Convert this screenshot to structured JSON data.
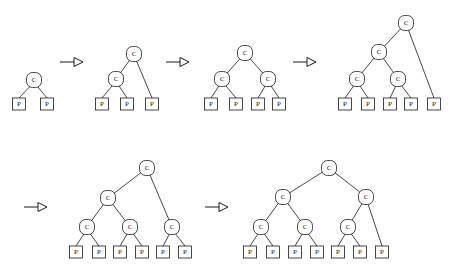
{
  "diagram": {
    "type": "tree-sequence",
    "background_color": "#ffffff",
    "stroke_color": "#1a1a1a",
    "node_labels": {
      "internal": "C",
      "leaf": "P"
    },
    "canvas": {
      "width": 449,
      "height": 275
    },
    "steps": [
      {
        "id": "step-1",
        "index": 1,
        "leaf_count": 2,
        "internal_count": 1,
        "nodes": [
          {
            "id": "s1c0",
            "kind": "internal",
            "label": "C",
            "x": 34,
            "y": 80
          },
          {
            "id": "s1p0",
            "kind": "leaf",
            "label": "P",
            "x": 19,
            "y": 104
          },
          {
            "id": "s1p1",
            "kind": "leaf",
            "label": "P",
            "x": 47,
            "y": 104
          }
        ],
        "edges": [
          {
            "from": "s1c0",
            "to": "s1p0"
          },
          {
            "from": "s1c0",
            "to": "s1p1"
          }
        ]
      },
      {
        "id": "step-2",
        "index": 2,
        "leaf_count": 3,
        "internal_count": 2,
        "nodes": [
          {
            "id": "s2c0",
            "kind": "internal",
            "label": "C",
            "x": 134,
            "y": 54
          },
          {
            "id": "s2c1",
            "kind": "internal",
            "label": "C",
            "x": 116,
            "y": 79
          },
          {
            "id": "s2p0",
            "kind": "leaf",
            "label": "P",
            "x": 102,
            "y": 104
          },
          {
            "id": "s2p1",
            "kind": "leaf",
            "label": "P",
            "x": 127,
            "y": 104
          },
          {
            "id": "s2p2",
            "kind": "leaf",
            "label": "P",
            "x": 152,
            "y": 104
          }
        ],
        "edges": [
          {
            "from": "s2c0",
            "to": "s2c1"
          },
          {
            "from": "s2c0",
            "to": "s2p2"
          },
          {
            "from": "s2c1",
            "to": "s2p0"
          },
          {
            "from": "s2c1",
            "to": "s2p1"
          }
        ]
      },
      {
        "id": "step-3",
        "index": 3,
        "leaf_count": 4,
        "internal_count": 3,
        "nodes": [
          {
            "id": "s3c0",
            "kind": "internal",
            "label": "C",
            "x": 245,
            "y": 53
          },
          {
            "id": "s3c1",
            "kind": "internal",
            "label": "C",
            "x": 222,
            "y": 79
          },
          {
            "id": "s3c2",
            "kind": "internal",
            "label": "C",
            "x": 268,
            "y": 79
          },
          {
            "id": "s3p0",
            "kind": "leaf",
            "label": "P",
            "x": 211,
            "y": 104
          },
          {
            "id": "s3p1",
            "kind": "leaf",
            "label": "P",
            "x": 236,
            "y": 104
          },
          {
            "id": "s3p2",
            "kind": "leaf",
            "label": "P",
            "x": 258,
            "y": 104
          },
          {
            "id": "s3p3",
            "kind": "leaf",
            "label": "P",
            "x": 279,
            "y": 104
          }
        ],
        "edges": [
          {
            "from": "s3c0",
            "to": "s3c1"
          },
          {
            "from": "s3c0",
            "to": "s3c2"
          },
          {
            "from": "s3c1",
            "to": "s3p0"
          },
          {
            "from": "s3c1",
            "to": "s3p1"
          },
          {
            "from": "s3c2",
            "to": "s3p2"
          },
          {
            "from": "s3c2",
            "to": "s3p3"
          }
        ]
      },
      {
        "id": "step-4",
        "index": 4,
        "leaf_count": 5,
        "internal_count": 4,
        "nodes": [
          {
            "id": "s4c0",
            "kind": "internal",
            "label": "C",
            "x": 406,
            "y": 23
          },
          {
            "id": "s4c1",
            "kind": "internal",
            "label": "C",
            "x": 379,
            "y": 52
          },
          {
            "id": "s4c2",
            "kind": "internal",
            "label": "C",
            "x": 357,
            "y": 79
          },
          {
            "id": "s4c3",
            "kind": "internal",
            "label": "C",
            "x": 398,
            "y": 79
          },
          {
            "id": "s4p0",
            "kind": "leaf",
            "label": "P",
            "x": 345,
            "y": 104
          },
          {
            "id": "s4p1",
            "kind": "leaf",
            "label": "P",
            "x": 368,
            "y": 104
          },
          {
            "id": "s4p2",
            "kind": "leaf",
            "label": "P",
            "x": 390,
            "y": 104
          },
          {
            "id": "s4p3",
            "kind": "leaf",
            "label": "P",
            "x": 411,
            "y": 104
          },
          {
            "id": "s4p4",
            "kind": "leaf",
            "label": "P",
            "x": 434,
            "y": 104
          }
        ],
        "edges": [
          {
            "from": "s4c0",
            "to": "s4c1"
          },
          {
            "from": "s4c0",
            "to": "s4p4"
          },
          {
            "from": "s4c1",
            "to": "s4c2"
          },
          {
            "from": "s4c1",
            "to": "s4c3"
          },
          {
            "from": "s4c2",
            "to": "s4p0"
          },
          {
            "from": "s4c2",
            "to": "s4p1"
          },
          {
            "from": "s4c3",
            "to": "s4p2"
          },
          {
            "from": "s4c3",
            "to": "s4p3"
          }
        ]
      },
      {
        "id": "step-5",
        "index": 5,
        "leaf_count": 6,
        "internal_count": 5,
        "nodes": [
          {
            "id": "s5c0",
            "kind": "internal",
            "label": "C",
            "x": 147,
            "y": 168
          },
          {
            "id": "s5c1",
            "kind": "internal",
            "label": "C",
            "x": 108,
            "y": 198
          },
          {
            "id": "s5c2",
            "kind": "internal",
            "label": "C",
            "x": 87,
            "y": 227
          },
          {
            "id": "s5c3",
            "kind": "internal",
            "label": "C",
            "x": 130,
            "y": 227
          },
          {
            "id": "s5c4",
            "kind": "internal",
            "label": "C",
            "x": 172,
            "y": 227
          },
          {
            "id": "s5p0",
            "kind": "leaf",
            "label": "P",
            "x": 76,
            "y": 252
          },
          {
            "id": "s5p1",
            "kind": "leaf",
            "label": "P",
            "x": 99,
            "y": 252
          },
          {
            "id": "s5p2",
            "kind": "leaf",
            "label": "P",
            "x": 120,
            "y": 252
          },
          {
            "id": "s5p3",
            "kind": "leaf",
            "label": "P",
            "x": 142,
            "y": 252
          },
          {
            "id": "s5p4",
            "kind": "leaf",
            "label": "P",
            "x": 163,
            "y": 252
          },
          {
            "id": "s5p5",
            "kind": "leaf",
            "label": "P",
            "x": 185,
            "y": 252
          }
        ],
        "edges": [
          {
            "from": "s5c0",
            "to": "s5c1"
          },
          {
            "from": "s5c0",
            "to": "s5c4"
          },
          {
            "from": "s5c1",
            "to": "s5c2"
          },
          {
            "from": "s5c1",
            "to": "s5c3"
          },
          {
            "from": "s5c2",
            "to": "s5p0"
          },
          {
            "from": "s5c2",
            "to": "s5p1"
          },
          {
            "from": "s5c3",
            "to": "s5p2"
          },
          {
            "from": "s5c3",
            "to": "s5p3"
          },
          {
            "from": "s5c4",
            "to": "s5p4"
          },
          {
            "from": "s5c4",
            "to": "s5p5"
          }
        ]
      },
      {
        "id": "step-6",
        "index": 6,
        "leaf_count": 7,
        "internal_count": 6,
        "nodes": [
          {
            "id": "s6c0",
            "kind": "internal",
            "label": "C",
            "x": 329,
            "y": 168
          },
          {
            "id": "s6c1",
            "kind": "internal",
            "label": "C",
            "x": 283,
            "y": 197
          },
          {
            "id": "s6c2",
            "kind": "internal",
            "label": "C",
            "x": 366,
            "y": 197
          },
          {
            "id": "s6c3",
            "kind": "internal",
            "label": "C",
            "x": 261,
            "y": 227
          },
          {
            "id": "s6c4",
            "kind": "internal",
            "label": "C",
            "x": 305,
            "y": 227
          },
          {
            "id": "s6c5",
            "kind": "internal",
            "label": "C",
            "x": 348,
            "y": 227
          },
          {
            "id": "s6p0",
            "kind": "leaf",
            "label": "P",
            "x": 250,
            "y": 252
          },
          {
            "id": "s6p1",
            "kind": "leaf",
            "label": "P",
            "x": 273,
            "y": 252
          },
          {
            "id": "s6p2",
            "kind": "leaf",
            "label": "P",
            "x": 295,
            "y": 252
          },
          {
            "id": "s6p3",
            "kind": "leaf",
            "label": "P",
            "x": 317,
            "y": 252
          },
          {
            "id": "s6p4",
            "kind": "leaf",
            "label": "P",
            "x": 338,
            "y": 252
          },
          {
            "id": "s6p5",
            "kind": "leaf",
            "label": "P",
            "x": 360,
            "y": 252
          },
          {
            "id": "s6p6",
            "kind": "leaf",
            "label": "P",
            "x": 382,
            "y": 252
          }
        ],
        "edges": [
          {
            "from": "s6c0",
            "to": "s6c1"
          },
          {
            "from": "s6c0",
            "to": "s6c2"
          },
          {
            "from": "s6c1",
            "to": "s6c3"
          },
          {
            "from": "s6c1",
            "to": "s6c4"
          },
          {
            "from": "s6c2",
            "to": "s6c5"
          },
          {
            "from": "s6c2",
            "to": "s6p6"
          },
          {
            "from": "s6c3",
            "to": "s6p0"
          },
          {
            "from": "s6c3",
            "to": "s6p1"
          },
          {
            "from": "s6c4",
            "to": "s6p2"
          },
          {
            "from": "s6c4",
            "to": "s6p3"
          },
          {
            "from": "s6c5",
            "to": "s6p4"
          },
          {
            "from": "s6c5",
            "to": "s6p5"
          }
        ]
      }
    ],
    "arrows": [
      {
        "id": "arrow-1",
        "from_step": "step-1",
        "to_step": "step-2",
        "x1": 60,
        "y1": 62,
        "x2": 83,
        "y2": 62
      },
      {
        "id": "arrow-2",
        "from_step": "step-2",
        "to_step": "step-3",
        "x1": 166,
        "y1": 62,
        "x2": 189,
        "y2": 62
      },
      {
        "id": "arrow-3",
        "from_step": "step-3",
        "to_step": "step-4",
        "x1": 293,
        "y1": 62,
        "x2": 316,
        "y2": 62
      },
      {
        "id": "arrow-4",
        "from_step": "step-4",
        "to_step": "step-5",
        "x1": 24,
        "y1": 207,
        "x2": 47,
        "y2": 207
      },
      {
        "id": "arrow-5",
        "from_step": "step-5",
        "to_step": "step-6",
        "x1": 205,
        "y1": 207,
        "x2": 228,
        "y2": 207
      }
    ],
    "geometry": {
      "c_radius": 7.5,
      "p_half_width": 6.5,
      "p_half_height": 6,
      "arrow_head_length": 9,
      "arrow_head_half_height": 4.5
    }
  }
}
